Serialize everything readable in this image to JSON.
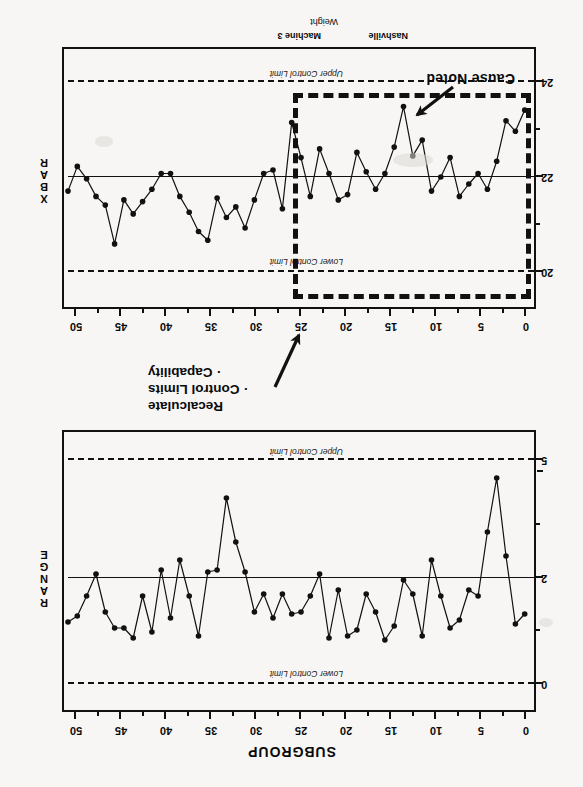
{
  "page": {
    "orientation_note": "scan rotated 180 degrees",
    "background_color": "#f7f6f4",
    "ink_color": "#111111"
  },
  "range_chart": {
    "vertical_axis_title": "RANGE",
    "x_axis_title": "SUBGROUP",
    "x_ticks": [
      0,
      5,
      10,
      15,
      20,
      25,
      30,
      35,
      40,
      45,
      50
    ],
    "y_ticks": [
      0,
      2,
      5
    ],
    "upper_limit_label": "Upper Control Limit",
    "lower_limit_label": "Lower Control Limit"
  },
  "xbar_chart": {
    "vertical_axis_title": "X BAR",
    "x_ticks": [
      0,
      5,
      10,
      15,
      20,
      25,
      30,
      35,
      40,
      45,
      50
    ],
    "y_ticks": [
      20,
      22,
      24
    ],
    "upper_limit_label": "Upper Control Limit",
    "lower_limit_label": "Lower Control Limit",
    "footer_left": "Nashville",
    "footer_center": "Machine 3",
    "footer_below": "Weight",
    "cause_annotation": "Cause Noted",
    "recalculate_lines": [
      "Recalculate",
      "· Control Limits",
      "· Capability"
    ]
  },
  "chart_data": [
    {
      "type": "line",
      "name": "xbar-chart",
      "title": "X BAR",
      "xlabel": "SUBGROUP",
      "ylabel": "X BAR",
      "xlim": [
        0,
        50
      ],
      "ylim": [
        19.2,
        24.6
      ],
      "center_line": 22.0,
      "upper_control_limit": 24.0,
      "lower_control_limit": 20.0,
      "grid": false,
      "markers": true,
      "x": [
        1,
        2,
        3,
        4,
        5,
        6,
        7,
        8,
        9,
        10,
        11,
        12,
        13,
        14,
        15,
        16,
        17,
        18,
        19,
        20,
        21,
        22,
        23,
        24,
        25,
        26,
        27,
        28,
        29,
        30,
        31,
        32,
        33,
        34,
        35,
        36,
        37,
        38,
        39,
        40,
        41,
        42,
        43,
        44,
        45,
        46,
        47,
        48,
        49,
        50
      ],
      "values": [
        23.8,
        23.2,
        23.5,
        22.35,
        21.55,
        22.0,
        21.7,
        21.35,
        22.45,
        21.9,
        21.5,
        22.95,
        22.5,
        23.9,
        22.75,
        22.0,
        21.55,
        22.05,
        22.6,
        21.4,
        21.25,
        22.0,
        22.7,
        21.35,
        22.45,
        23.45,
        21.0,
        22.1,
        22.0,
        21.25,
        20.45,
        21.05,
        20.75,
        21.3,
        20.1,
        20.35,
        20.9,
        21.35,
        22.0,
        22.0,
        21.55,
        21.2,
        20.85,
        21.25,
        20.0,
        21.1,
        21.35,
        21.85,
        22.2,
        21.5
      ],
      "annotations": [
        {
          "text": "Cause Noted",
          "anchor_x": 14,
          "anchor_y": 23.3
        },
        {
          "text": "Recalculate · Control Limits · Capability",
          "anchor_x": 26,
          "anchor_y": 19.6
        }
      ],
      "highlight_box": {
        "x_start": 25,
        "x_end": 50.5,
        "y_low": 19.45,
        "y_high": 23.35
      }
    },
    {
      "type": "line",
      "name": "range-chart",
      "title": "RANGE",
      "xlabel": "SUBGROUP",
      "ylabel": "RANGE",
      "xlim": [
        0,
        50
      ],
      "ylim": [
        -0.2,
        5.4
      ],
      "center_line": 2.0,
      "upper_control_limit": 5.0,
      "lower_control_limit": 0.0,
      "grid": false,
      "markers": true,
      "x": [
        1,
        2,
        3,
        4,
        5,
        6,
        7,
        8,
        9,
        10,
        11,
        12,
        13,
        14,
        15,
        16,
        17,
        18,
        19,
        20,
        21,
        22,
        23,
        24,
        25,
        26,
        27,
        28,
        29,
        30,
        31,
        32,
        33,
        34,
        35,
        36,
        37,
        38,
        39,
        40,
        41,
        42,
        43,
        44,
        45,
        46,
        47,
        48,
        49,
        50
      ],
      "values": [
        1.55,
        1.3,
        3.0,
        4.95,
        3.6,
        2.0,
        2.15,
        1.4,
        1.2,
        2.0,
        2.9,
        1.0,
        2.05,
        2.4,
        1.25,
        0.9,
        1.6,
        2.05,
        1.15,
        1.0,
        2.15,
        0.95,
        2.55,
        2.0,
        1.6,
        1.55,
        2.05,
        1.45,
        2.05,
        1.6,
        2.6,
        3.35,
        4.45,
        2.65,
        2.6,
        1.0,
        2.0,
        2.9,
        1.45,
        2.65,
        1.1,
        2.0,
        0.95,
        1.2,
        1.2,
        1.6,
        2.55,
        2.0,
        1.5,
        1.35
      ]
    }
  ]
}
